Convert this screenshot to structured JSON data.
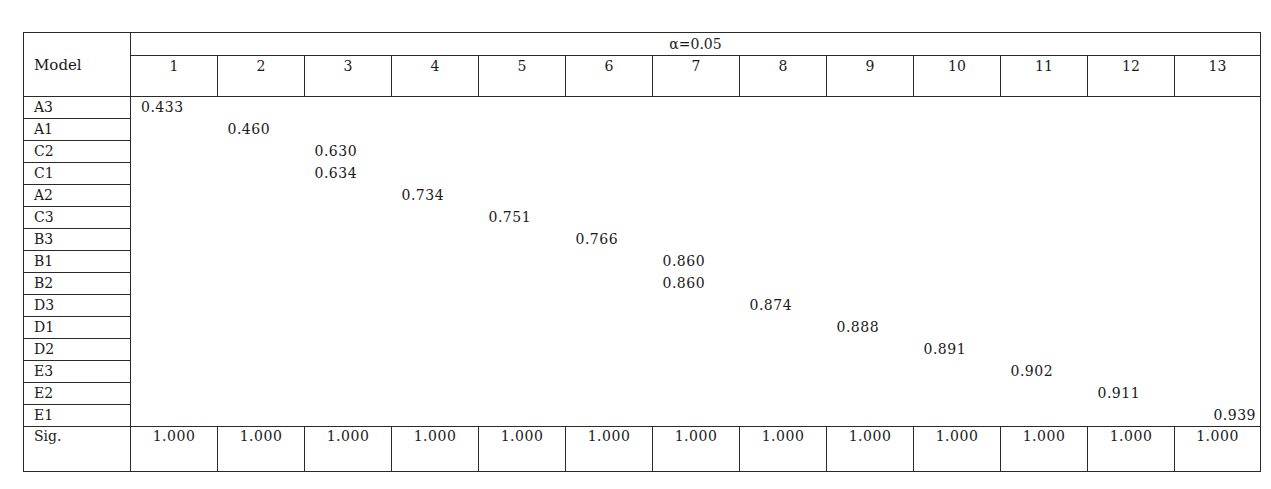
{
  "table": {
    "corner_label": "Model",
    "group_header": "α=0.05",
    "subset_headers": [
      "1",
      "2",
      "3",
      "4",
      "5",
      "6",
      "7",
      "8",
      "9",
      "10",
      "11",
      "12",
      "13"
    ],
    "rows": [
      {
        "model": "A3",
        "subset": 1,
        "value": "0.433"
      },
      {
        "model": "A1",
        "subset": 2,
        "value": "0.460"
      },
      {
        "model": "C2",
        "subset": 3,
        "value": "0.630"
      },
      {
        "model": "C1",
        "subset": 3,
        "value": "0.634"
      },
      {
        "model": "A2",
        "subset": 4,
        "value": "0.734"
      },
      {
        "model": "C3",
        "subset": 5,
        "value": "0.751"
      },
      {
        "model": "B3",
        "subset": 6,
        "value": "0.766"
      },
      {
        "model": "B1",
        "subset": 7,
        "value": "0.860"
      },
      {
        "model": "B2",
        "subset": 7,
        "value": "0.860"
      },
      {
        "model": "D3",
        "subset": 8,
        "value": "0.874"
      },
      {
        "model": "D1",
        "subset": 9,
        "value": "0.888"
      },
      {
        "model": "D2",
        "subset": 10,
        "value": "0.891"
      },
      {
        "model": "E3",
        "subset": 11,
        "value": "0.902"
      },
      {
        "model": "E2",
        "subset": 12,
        "value": "0.911"
      },
      {
        "model": "E1",
        "subset": 13,
        "value": "0.939"
      }
    ],
    "sig_label": "Sig.",
    "sig_values": [
      "1.000",
      "1.000",
      "1.000",
      "1.000",
      "1.000",
      "1.000",
      "1.000",
      "1.000",
      "1.000",
      "1.000",
      "1.000",
      "1.000",
      "1.000"
    ]
  }
}
